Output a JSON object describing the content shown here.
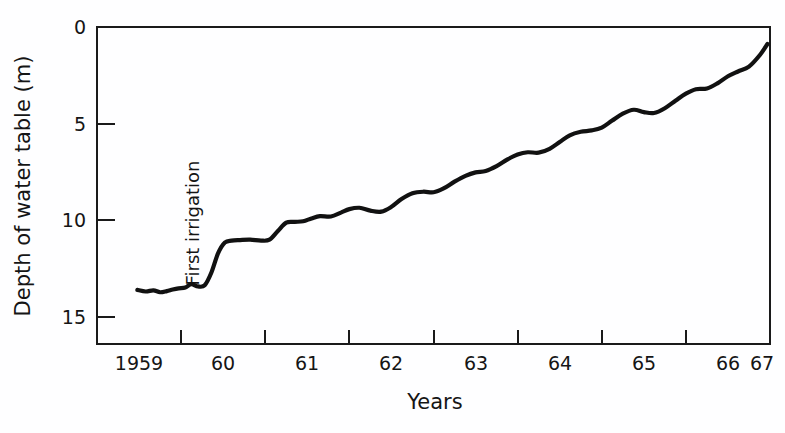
{
  "chart_data": {
    "type": "line",
    "title": "",
    "xlabel": "Years",
    "ylabel": "Depth of water table (m)",
    "xlim": [
      1959,
      1967
    ],
    "ylim": [
      0,
      16
    ],
    "y_inverted": true,
    "grid": false,
    "legend": null,
    "x_tick_labels": [
      "1959",
      "60",
      "61",
      "62",
      "63",
      "64",
      "65",
      "66",
      "67"
    ],
    "x_tick_values": [
      1959,
      1960,
      1961,
      1962,
      1963,
      1964,
      1965,
      1966,
      1967
    ],
    "y_tick_labels": [
      "0",
      "5",
      "10",
      "15"
    ],
    "y_tick_values": [
      0,
      5,
      10,
      15
    ],
    "annotations": [
      {
        "text": "First irrigation",
        "x": 1960.0,
        "rotation": -90
      }
    ],
    "series": [
      {
        "name": "Depth of water table",
        "x": [
          1959.48,
          1959.58,
          1959.67,
          1959.75,
          1959.83,
          1959.9,
          1959.97,
          1960.05,
          1960.12,
          1960.2,
          1960.28,
          1960.36,
          1960.44,
          1960.52,
          1960.6,
          1960.7,
          1960.82,
          1960.95,
          1961.05,
          1961.15,
          1961.25,
          1961.35,
          1961.45,
          1961.55,
          1961.65,
          1961.78,
          1961.9,
          1962.0,
          1962.12,
          1962.25,
          1962.38,
          1962.5,
          1962.62,
          1962.75,
          1962.88,
          1963.0,
          1963.12,
          1963.25,
          1963.38,
          1963.5,
          1963.62,
          1963.75,
          1963.88,
          1964.0,
          1964.12,
          1964.25,
          1964.38,
          1964.5,
          1964.62,
          1964.75,
          1964.88,
          1965.0,
          1965.12,
          1965.25,
          1965.38,
          1965.5,
          1965.62,
          1965.75,
          1965.88,
          1966.0,
          1966.12,
          1966.25,
          1966.38,
          1966.5,
          1966.62,
          1966.75,
          1966.88,
          1966.97
        ],
        "y": [
          13.6,
          13.68,
          13.62,
          13.72,
          13.66,
          13.58,
          13.52,
          13.48,
          13.3,
          13.42,
          13.36,
          12.7,
          11.7,
          11.15,
          11.05,
          11.02,
          11.0,
          11.05,
          11.0,
          10.55,
          10.12,
          10.08,
          10.05,
          9.9,
          9.78,
          9.8,
          9.6,
          9.42,
          9.35,
          9.5,
          9.55,
          9.3,
          8.9,
          8.6,
          8.52,
          8.55,
          8.35,
          8.0,
          7.7,
          7.52,
          7.45,
          7.2,
          6.85,
          6.6,
          6.48,
          6.5,
          6.3,
          5.95,
          5.6,
          5.42,
          5.35,
          5.2,
          4.85,
          4.48,
          4.28,
          4.4,
          4.45,
          4.2,
          3.8,
          3.45,
          3.22,
          3.18,
          2.9,
          2.55,
          2.3,
          2.05,
          1.45,
          0.88
        ]
      }
    ]
  }
}
